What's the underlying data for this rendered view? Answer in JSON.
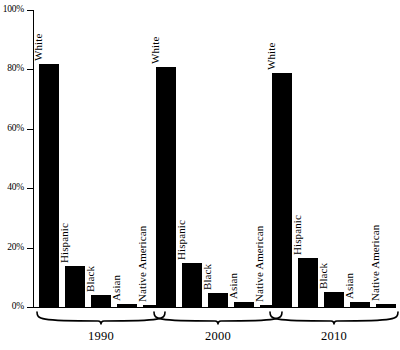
{
  "chart_data": {
    "type": "bar",
    "title": "",
    "xlabel": "",
    "ylabel": "",
    "ylim": [
      0,
      100
    ],
    "grid": false,
    "legend": "none",
    "y_ticks": [
      "0%",
      "20%",
      "40%",
      "60%",
      "80%",
      "100%"
    ],
    "y_tick_values": [
      0,
      20,
      40,
      60,
      80,
      100
    ],
    "categories": [
      "White",
      "Hispanic",
      "Black",
      "Asian",
      "Native American"
    ],
    "groups": [
      "1990",
      "2000",
      "2010"
    ],
    "series": [
      {
        "name": "1990",
        "values": [
          82,
          14,
          4.5,
          1.5,
          1.0
        ]
      },
      {
        "name": "2000",
        "values": [
          81,
          15,
          5.0,
          2.0,
          1.0
        ]
      },
      {
        "name": "2010",
        "values": [
          79,
          17,
          5.5,
          2.0,
          1.5
        ]
      }
    ],
    "bar_color": "#000000",
    "axis_color": "#000000",
    "background_color": "#ffffff"
  }
}
